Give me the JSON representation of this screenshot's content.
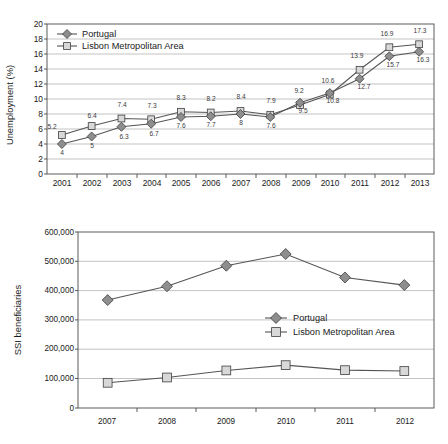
{
  "chart_data": [
    {
      "type": "line",
      "title": "",
      "xlabel": "",
      "ylabel": "Unemployment (%)",
      "categories": [
        "2001",
        "2002",
        "2003",
        "2004",
        "2005",
        "2006",
        "2007",
        "2008",
        "2009",
        "2010",
        "2011",
        "2012",
        "2013"
      ],
      "ylim": [
        0,
        20
      ],
      "yticks": [
        "0",
        "2",
        "4",
        "6",
        "8",
        "10",
        "12",
        "14",
        "16",
        "18",
        "20"
      ],
      "grid": true,
      "legend_position": "top-left",
      "series": [
        {
          "name": "Portugal",
          "marker": "diamond",
          "values": [
            4,
            5,
            6.3,
            6.7,
            7.6,
            7.7,
            8,
            7.6,
            9.5,
            10.8,
            12.7,
            15.7,
            16.3
          ],
          "labels": [
            "4",
            "5",
            "6.3",
            "6.7",
            "7.6",
            "7.7",
            "8",
            "7.6",
            "9.5",
            "10.8",
            "12.7",
            "15.7",
            "16.3"
          ]
        },
        {
          "name": "Lisbon Metropolitan Area",
          "marker": "square",
          "values": [
            5.2,
            6.4,
            7.4,
            7.3,
            8.3,
            8.2,
            8.4,
            7.9,
            9.2,
            10.6,
            13.9,
            16.9,
            17.3
          ],
          "labels": [
            "5.2",
            "6.4",
            "7.4",
            "7.3",
            "8.3",
            "8.2",
            "8.4",
            "7.9",
            "9.2",
            "10.6",
            "13.9",
            "16.9",
            "17.3"
          ]
        }
      ]
    },
    {
      "type": "line",
      "title": "",
      "xlabel": "",
      "ylabel": "SSI beneficiaries",
      "categories": [
        "2007",
        "2008",
        "2009",
        "2010",
        "2011",
        "2012"
      ],
      "ylim": [
        0,
        600000
      ],
      "yticks": [
        "0",
        "100,000",
        "200,000",
        "300,000",
        "400,000",
        "500,000",
        "600,000"
      ],
      "grid": true,
      "legend_position": "center-right",
      "series": [
        {
          "name": "Portugal",
          "marker": "diamond",
          "values": [
            368000,
            415000,
            485000,
            525000,
            445000,
            419000
          ]
        },
        {
          "name": "Lisbon Metropolitan Area",
          "marker": "square",
          "values": [
            86000,
            104000,
            128000,
            146000,
            129000,
            126000
          ]
        }
      ]
    }
  ],
  "colors": {
    "line": "#555555",
    "diamond_fill": "#8e8e8e",
    "square_fill": "#d8d8d8",
    "grid": "#9a9a9a",
    "frame": "#4a4a4a"
  }
}
